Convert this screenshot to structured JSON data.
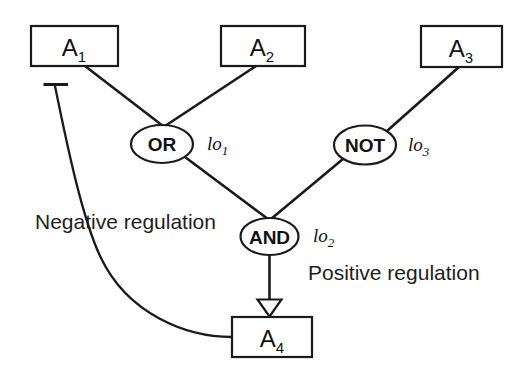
{
  "diagram": {
    "background_color": "#ffffff",
    "stroke_color": "#1a1a1a",
    "nodes": [
      {
        "id": "A1",
        "base": "A",
        "sub": "1",
        "shape": "rect",
        "x": 31,
        "y": 26,
        "w": 87,
        "h": 40
      },
      {
        "id": "A2",
        "base": "A",
        "sub": "2",
        "shape": "rect",
        "x": 221,
        "y": 26,
        "w": 84,
        "h": 40
      },
      {
        "id": "A3",
        "base": "A",
        "sub": "3",
        "shape": "rect",
        "x": 421,
        "y": 26,
        "w": 81,
        "h": 41
      },
      {
        "id": "A4",
        "base": "A",
        "sub": "4",
        "shape": "rect",
        "x": 232,
        "y": 317,
        "w": 80,
        "h": 40
      }
    ],
    "gates": [
      {
        "id": "OR",
        "label": "OR",
        "cx": 162,
        "cy": 144,
        "rx": 31,
        "ry": 19
      },
      {
        "id": "NOT",
        "label": "NOT",
        "cx": 365,
        "cy": 145,
        "rx": 31,
        "ry": 19.5
      },
      {
        "id": "AND",
        "label": "AND",
        "cx": 269.5,
        "cy": 236.5,
        "rx": 29,
        "ry": 18.5
      }
    ],
    "io_labels": [
      {
        "id": "lo1",
        "base": "lo",
        "sub": "1",
        "x": 207,
        "y": 150
      },
      {
        "id": "lo2",
        "base": "lo",
        "sub": "2",
        "x": 313,
        "y": 242
      },
      {
        "id": "lo3",
        "base": "lo",
        "sub": "3",
        "x": 408,
        "y": 151
      }
    ],
    "annotations": [
      {
        "id": "negative-regulation",
        "text": "Negative regulation",
        "x": 35,
        "y": 229
      },
      {
        "id": "positive-regulation",
        "text": "Positive regulation",
        "x": 308,
        "y": 280
      }
    ],
    "edges": [
      {
        "id": "A1-to-OR",
        "from": "A1",
        "to": "OR",
        "kind": "line"
      },
      {
        "id": "A2-to-OR",
        "from": "A2",
        "to": "OR",
        "kind": "line"
      },
      {
        "id": "A3-to-NOT",
        "from": "A3",
        "to": "NOT",
        "kind": "line"
      },
      {
        "id": "OR-to-AND",
        "from": "OR",
        "to": "AND",
        "kind": "line"
      },
      {
        "id": "NOT-to-AND",
        "from": "NOT",
        "to": "AND",
        "kind": "line"
      },
      {
        "id": "AND-to-A4",
        "from": "AND",
        "to": "A4",
        "kind": "arrow",
        "arrow": "hollow-triangle",
        "meaning": "Positive regulation"
      },
      {
        "id": "A4-to-A1",
        "from": "A4",
        "to": "A1",
        "kind": "curve",
        "arrow": "inhibition-bar",
        "meaning": "Negative regulation"
      }
    ]
  }
}
